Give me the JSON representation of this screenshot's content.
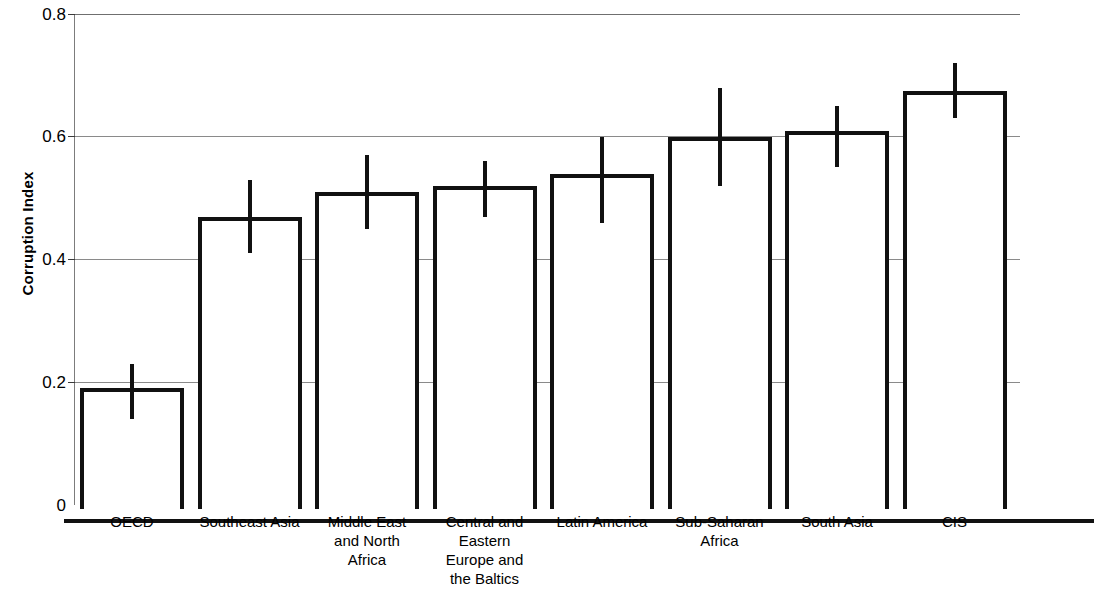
{
  "chart_data": {
    "type": "bar",
    "title": "",
    "subtitle": "",
    "xlabel": "",
    "ylabel": "Corruption Index",
    "ylim": [
      0,
      0.8
    ],
    "ytick_labels": [
      "0.8",
      "0.6",
      "0.4",
      "0.2",
      "0"
    ],
    "ytick_values": [
      0.8,
      0.6,
      0.4,
      0.2,
      0
    ],
    "grid": "horizontal",
    "legend": "none",
    "error_bar_type": "whisker-with-caps",
    "categories": [
      "OECD",
      "Southeast Asia",
      "Middle East and North Africa",
      "Central and Eastern Europe and the Baltics",
      "Latin America",
      "Sub-Saharan Africa",
      "South Asia",
      "CIS"
    ],
    "category_label_lines": [
      [
        "OECD"
      ],
      [
        "Southeast Asia"
      ],
      [
        "Middle East",
        "and North",
        "Africa"
      ],
      [
        "Central and",
        "Eastern",
        "Europe and",
        "the Baltics"
      ],
      [
        "Latin America"
      ],
      [
        "Sub-Saharan",
        "Africa"
      ],
      [
        "South Asia"
      ],
      [
        "CIS"
      ]
    ],
    "values": [
      0.19,
      0.47,
      0.51,
      0.52,
      0.54,
      0.6,
      0.61,
      0.675
    ],
    "error_low": [
      0.14,
      0.41,
      0.45,
      0.47,
      0.46,
      0.52,
      0.55,
      0.63
    ],
    "error_high": [
      0.23,
      0.53,
      0.57,
      0.56,
      0.6,
      0.68,
      0.65,
      0.72
    ],
    "series": [
      {
        "name": "Corruption Index",
        "values": [
          0.19,
          0.47,
          0.51,
          0.52,
          0.54,
          0.6,
          0.61,
          0.675
        ]
      }
    ]
  },
  "style": {
    "bar_fill": "#ffffff",
    "bar_outline": "#111111",
    "gridline_color": "#8a8a8a",
    "axis_color": "#111111",
    "text_color": "#000000",
    "background": "#ffffff"
  }
}
